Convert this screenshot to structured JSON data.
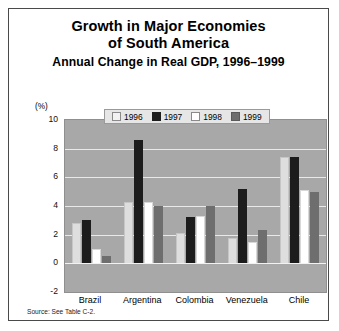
{
  "figure": {
    "title_line1": "Growth in Major Economies",
    "title_line2": "of South America",
    "subtitle": "Annual Change in Real GDP, 1996–1999",
    "y_unit_label": "(%)",
    "source_note": "Source: See Table C-2."
  },
  "chart_data": {
    "type": "bar",
    "title": "Growth in Major Economies of South America",
    "subtitle": "Annual Change in Real GDP, 1996–1999",
    "xlabel": "",
    "ylabel": "(%)",
    "ylim": [
      -2,
      10
    ],
    "yticks": [
      10,
      8,
      6,
      4,
      2,
      0,
      -2
    ],
    "ytick_labels": [
      "10",
      "8",
      "6",
      "4",
      "2",
      "0",
      "-2"
    ],
    "grid": true,
    "legend_position": "top-center",
    "categories": [
      "Brazil",
      "Argentina",
      "Colombia",
      "Venezuela",
      "Chile"
    ],
    "series": [
      {
        "name": "1996",
        "color": "#dedede",
        "values": [
          2.8,
          4.3,
          2.1,
          1.8,
          7.4
        ]
      },
      {
        "name": "1997",
        "color": "#1c1c1c",
        "values": [
          3.0,
          8.6,
          3.2,
          5.2,
          7.4
        ]
      },
      {
        "name": "1998",
        "color": "#ffffff",
        "values": [
          1.0,
          4.3,
          3.3,
          1.5,
          5.1
        ]
      },
      {
        "name": "1999",
        "color": "#6e6e6e",
        "values": [
          0.5,
          4.0,
          4.0,
          2.3,
          5.0
        ]
      }
    ]
  }
}
